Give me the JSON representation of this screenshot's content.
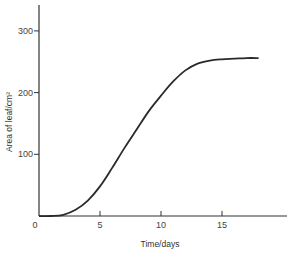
{
  "chart_data": {
    "type": "line",
    "title": "",
    "xlabel": "Time/days",
    "ylabel": "Area of leaf/cm²",
    "xlim": [
      0,
      20
    ],
    "ylim": [
      0,
      340
    ],
    "x_ticks": [
      0,
      5,
      10,
      15
    ],
    "y_ticks": [
      100,
      200,
      300
    ],
    "grid": false,
    "legend": null,
    "series": [
      {
        "name": "Leaf area",
        "x": [
          0,
          1,
          2,
          3,
          4,
          5,
          6,
          7,
          8,
          9,
          10,
          11,
          12,
          13,
          14,
          15,
          16,
          17,
          18
        ],
        "values": [
          0,
          0,
          2,
          10,
          25,
          48,
          78,
          110,
          140,
          170,
          195,
          218,
          236,
          247,
          252,
          254,
          255,
          256,
          256
        ]
      }
    ],
    "colors": {
      "line": "#2a2a2a",
      "axis": "#333333"
    }
  }
}
